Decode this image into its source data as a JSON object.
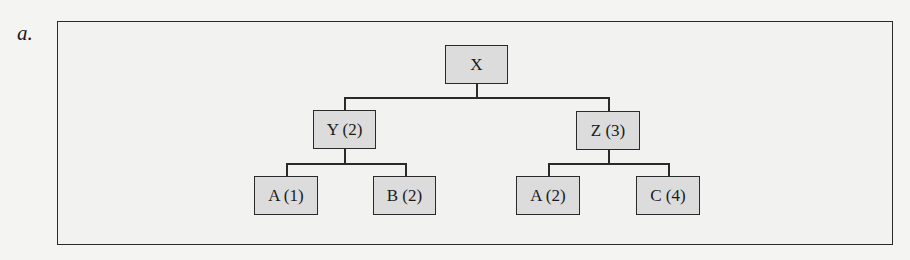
{
  "figure_label": "a.",
  "tree": {
    "root": {
      "label": "X"
    },
    "level1": [
      {
        "label": "Y (2)"
      },
      {
        "label": "Z (3)"
      }
    ],
    "level2": [
      {
        "label": "A (1)",
        "parent": "Y (2)"
      },
      {
        "label": "B (2)",
        "parent": "Y (2)"
      },
      {
        "label": "A (2)",
        "parent": "Z (3)"
      },
      {
        "label": "C (4)",
        "parent": "Z (3)"
      }
    ]
  },
  "colors": {
    "node_fill": "#dcdcdc",
    "line": "#2a2a2a",
    "background": "#f2f2f0"
  }
}
